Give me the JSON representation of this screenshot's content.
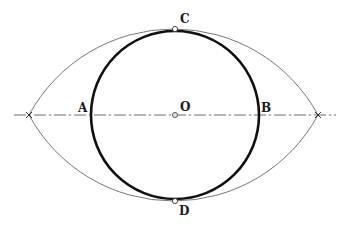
{
  "diagram": {
    "type": "geometric-construction",
    "labels": {
      "top": "C",
      "bottom": "D",
      "left": "A",
      "right": "B",
      "center": "O"
    },
    "colors": {
      "circle": "#111111",
      "arcs": "#555555",
      "axis": "#444444",
      "point_fill": "#ffffff",
      "text": "#1a1a1a"
    }
  }
}
